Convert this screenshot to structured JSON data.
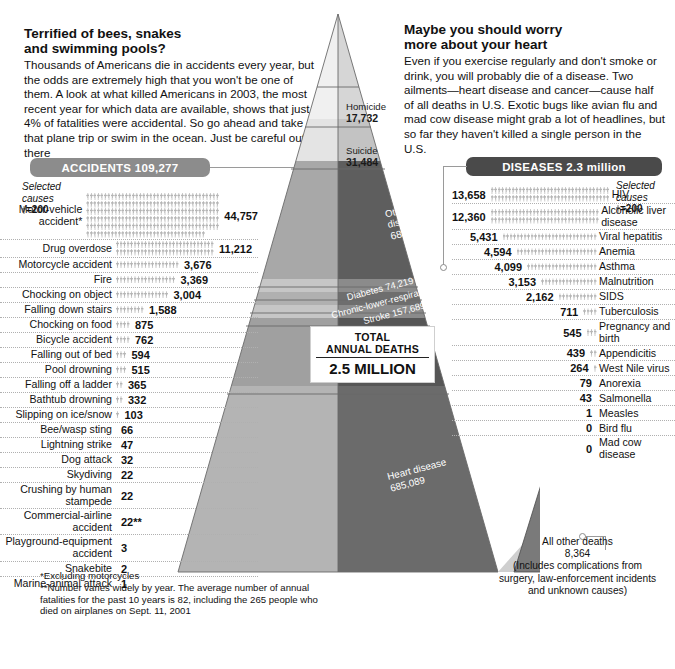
{
  "left_panel": {
    "headline": "Terrified of bees, snakes\nand swimming pools?",
    "deck": "Thousands of Americans die in accidents every year, but the odds are extremely high that you won't be one of them. A look at what killed Americans in 2003,  the most recent year for which data are available, shows that just 4% of fatalities were accidental. So go ahead and take that plane trip or swim in the ocean. Just be careful out there",
    "banner_label": "ACCIDENTS 109,277",
    "selected_causes_note": "Selected\ncauses",
    "scale_note": "=200"
  },
  "right_panel": {
    "headline": "Maybe you should worry\nmore about your heart",
    "deck": "Even if you exercise regularly and don't smoke or drink, you will probably die of a disease. Two ailments—heart disease and cancer—cause half of all deaths in U.S. Exotic bugs like avian flu and mad cow disease might grab a lot of headlines, but so far they haven't killed a single person in the U.S.",
    "banner_label": "DISEASES 2.3 million",
    "selected_causes_note": "Selected\ncauses",
    "scale_note": "=200"
  },
  "total_box": {
    "line1": "TOTAL",
    "line2": "ANNUAL DEATHS",
    "line3": "2.5 MILLION"
  },
  "footnote": "*Excluding motorcycles\n**Number varies widely by year. The average number of annual fatalities for the past 10 years is 82,  including the 265 people who died on airplanes on Sept. 11, 2001",
  "small_pyramid_note": "All other deaths\n8,364\n(Includes complications from\nsurgery, law-enforcement incidents\nand unknown causes)",
  "colors": {
    "accidents_banner": "#8c8c8c",
    "diseases_banner": "#4a4a4a",
    "picto": "#b5b5b5",
    "leader_line": "#9a9a9a"
  },
  "chart_data": {
    "type": "bar",
    "unit": "deaths per year",
    "picto_unit_value": 200,
    "total_annual_deaths": 2500000,
    "accidents_total": 109277,
    "diseases_total": 2300000,
    "accidents": {
      "title": "ACCIDENTS 109,277",
      "xlabel": "",
      "ylabel": "Deaths",
      "categories": [
        "Motor-vehicle accident*",
        "Drug overdose",
        "Motorcycle accident",
        "Fire",
        "Chocking on object",
        "Falling down stairs",
        "Chocking on food",
        "Bicycle accident",
        "Falling out of bed",
        "Pool drowning",
        "Falling off a ladder",
        "Bathtub drowning",
        "Slipping on ice/snow",
        "Bee/wasp sting",
        "Lightning strike",
        "Dog attack",
        "Skydiving",
        "Crushing by human stampede",
        "Commercial-airline accident",
        "Playground-equipment accident",
        "Snakebite",
        "Marine-animal attack"
      ],
      "values": [
        44757,
        11212,
        3676,
        3369,
        3004,
        1588,
        875,
        762,
        594,
        515,
        365,
        332,
        103,
        66,
        47,
        32,
        22,
        22,
        22,
        3,
        2,
        1
      ],
      "value_labels": [
        "44,757",
        "11,212",
        "3,676",
        "3,369",
        "3,004",
        "1,588",
        "875",
        "762",
        "594",
        "515",
        "365",
        "332",
        "103",
        "66",
        "47",
        "32",
        "22",
        "22",
        "22**",
        "3",
        "2",
        "1"
      ]
    },
    "diseases": {
      "title": "DISEASES 2.3 million",
      "xlabel": "",
      "ylabel": "Deaths",
      "categories": [
        "HIV",
        "Alcoholic liver disease",
        "Viral hepatitis",
        "Anemia",
        "Asthma",
        "Malnutrition",
        "SIDS",
        "Tuberculosis",
        "Pregnancy and birth",
        "Appendicitis",
        "West Nile virus",
        "Anorexia",
        "Salmonella",
        "Measles",
        "Bird flu",
        "Mad cow disease"
      ],
      "values": [
        13658,
        12360,
        5431,
        4594,
        4099,
        3153,
        2162,
        711,
        545,
        439,
        264,
        79,
        43,
        1,
        0,
        0
      ],
      "value_labels": [
        "13,658",
        "12,360",
        "5,431",
        "4,594",
        "4,099",
        "3,153",
        "2,162",
        "711",
        "545",
        "439",
        "264",
        "79",
        "43",
        "1",
        "0",
        "0"
      ]
    },
    "pyramid_tiers": [
      {
        "label": "Homicide",
        "value": 17732,
        "value_label": "17,732"
      },
      {
        "label": "Suicide",
        "value": 31484,
        "value_label": "31,484"
      },
      {
        "label": "Other diseases",
        "value": 681150,
        "value_label": "681,150"
      },
      {
        "label": "Diabetes",
        "value": 74219,
        "value_label": "74,219"
      },
      {
        "label": "Chronic-lower-respiratory disease",
        "value": 126382,
        "value_label": "126,382"
      },
      {
        "label": "Stroke",
        "value": 157689,
        "value_label": "157,689"
      },
      {
        "label": "Cancer",
        "value": 556902,
        "value_label": "556,902"
      },
      {
        "label": "Heart disease",
        "value": 685089,
        "value_label": "685,089"
      },
      {
        "label": "All other deaths",
        "value": 8364,
        "value_label": "8,364"
      }
    ]
  }
}
